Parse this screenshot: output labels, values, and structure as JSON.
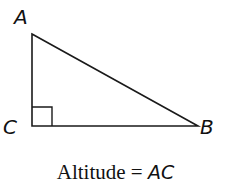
{
  "diagram": {
    "type": "right-triangle",
    "vertices": {
      "A": {
        "label": "A",
        "x": 32,
        "y": 34
      },
      "B": {
        "label": "B",
        "x": 198,
        "y": 126
      },
      "C": {
        "label": "C",
        "x": 32,
        "y": 126
      }
    },
    "right_angle_at": "C",
    "stroke_color": "#1a1a1a"
  },
  "caption": {
    "prefix": "Altitude = ",
    "segment": "AC"
  }
}
